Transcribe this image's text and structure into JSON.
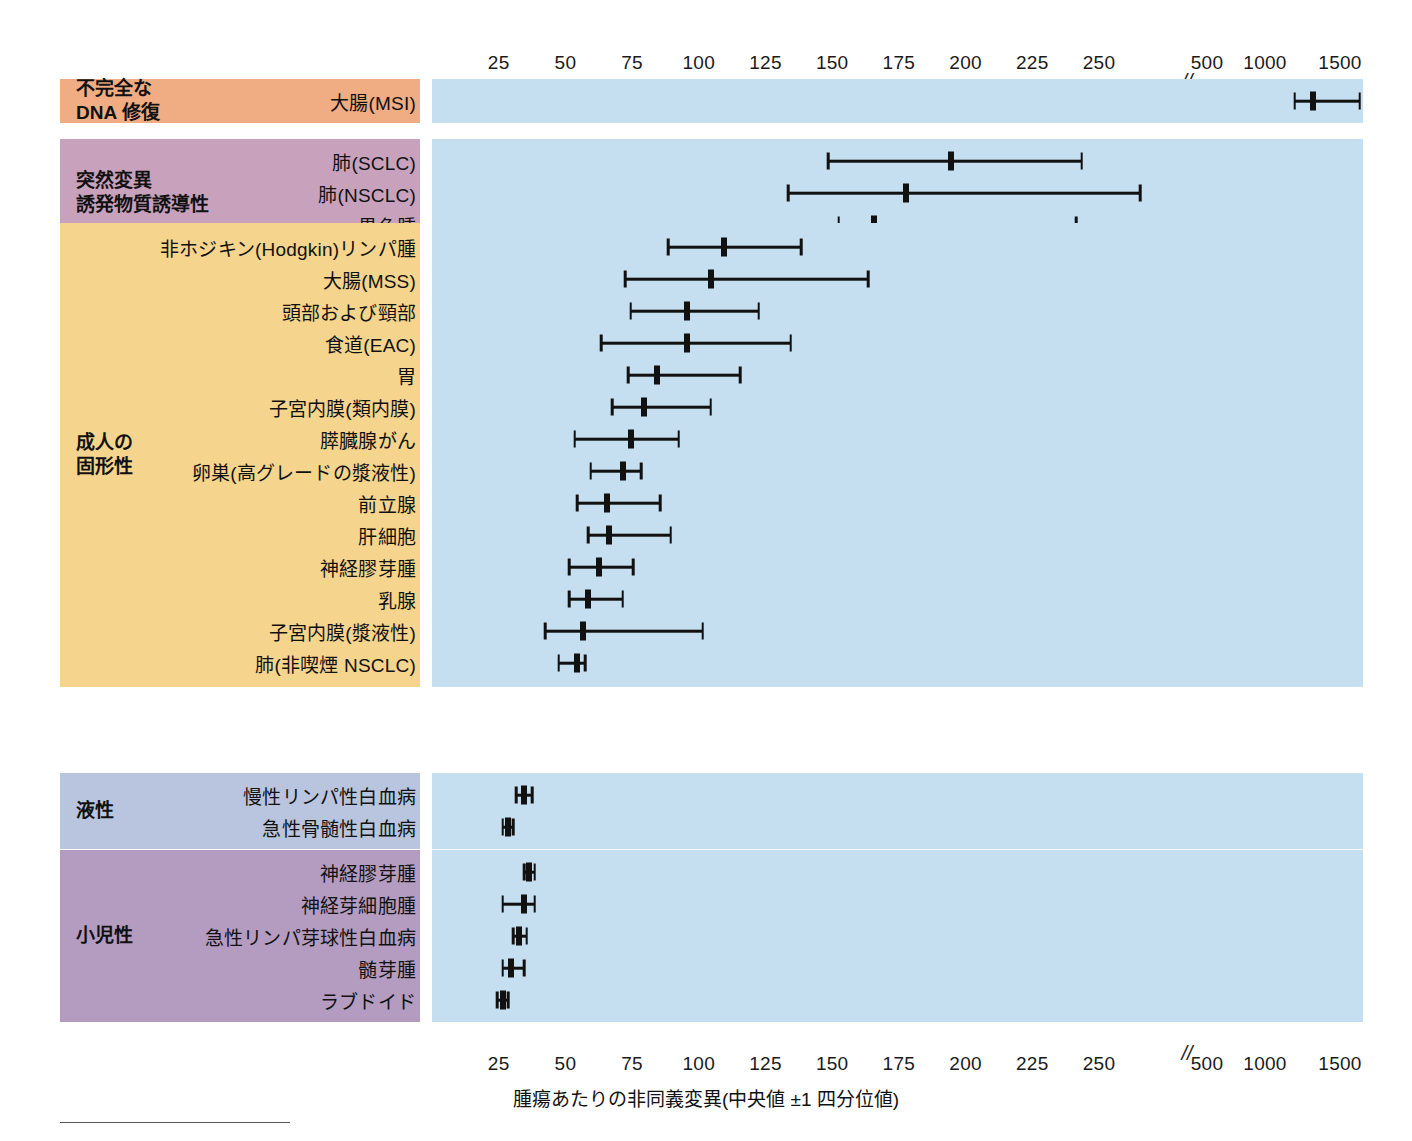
{
  "axis": {
    "caption": "腫瘍あたりの非同義変異(中央値 ±1 四分位値)",
    "break_symbol": "//",
    "ticks_linear": [
      "25",
      "50",
      "75",
      "100",
      "125",
      "150",
      "175",
      "200",
      "225",
      "250"
    ],
    "ticks_log": [
      "500",
      "1000",
      "1500"
    ]
  },
  "colors": {
    "plot_background": "#c6dff0",
    "page_background": "#ffffff",
    "mark_color": "#111111",
    "band_dna_repair": "#f0ac82",
    "band_mutagen": "#c8a2bd",
    "band_adult_solid": "#f5d48d",
    "band_liquid": "#b9c5de",
    "band_pediatric": "#b49bc0"
  },
  "chart_data": {
    "type": "scatter",
    "title": "",
    "xlabel": "腫瘍あたりの非同義変異(中央値 ±1 四分位値)",
    "ylabel": "",
    "xlim": [
      0,
      1500
    ],
    "axis_break_after": 250,
    "grid": false,
    "legend": "none",
    "sections": [
      {
        "name": "不完全な\nDNA 修復",
        "color": "#f0ac82",
        "rows": [
          {
            "label": "大腸(MSI)",
            "low": 740,
            "median": 900,
            "high": 1230
          }
        ]
      },
      {
        "name": "突然変異\n誘発物質誘導性",
        "color": "#c8a2bd",
        "rows": [
          {
            "label": "肺(SCLC)",
            "low": 126,
            "median": 172,
            "high": 221
          },
          {
            "label": "肺(NSCLC)",
            "low": 111,
            "median": 155,
            "high": 243
          },
          {
            "label": "黒色腫",
            "low": 130,
            "median": 143,
            "high": 219
          }
        ]
      },
      {
        "name": "成人の\n固形性",
        "color": "#f5d48d",
        "rows": [
          {
            "label": "非ホジキン(Hodgkin)リンパ腫",
            "low": 66,
            "median": 87,
            "high": 116
          },
          {
            "label": "大腸(MSS)",
            "low": 50,
            "median": 82,
            "high": 141
          },
          {
            "label": "頭部および頸部",
            "low": 52,
            "median": 73,
            "high": 100
          },
          {
            "label": "食道(EAC)",
            "low": 41,
            "median": 73,
            "high": 112
          },
          {
            "label": "胃",
            "low": 51,
            "median": 62,
            "high": 93
          },
          {
            "label": "子宮内膜(類内膜)",
            "low": 45,
            "median": 57,
            "high": 82
          },
          {
            "label": "膵臓腺がん",
            "low": 31,
            "median": 52,
            "high": 70
          },
          {
            "label": "卵巣(高グレードの漿液性)",
            "low": 37,
            "median": 49,
            "high": 56
          },
          {
            "label": "前立腺",
            "low": 32,
            "median": 43,
            "high": 63
          },
          {
            "label": "肝細胞",
            "low": 36,
            "median": 44,
            "high": 67
          },
          {
            "label": "神経膠芽腫",
            "low": 29,
            "median": 40,
            "high": 53
          },
          {
            "label": "乳腺",
            "low": 29,
            "median": 36,
            "high": 49
          },
          {
            "label": "子宮内膜(漿液性)",
            "low": 20,
            "median": 34,
            "high": 79
          },
          {
            "label": "肺(非喫煙 NSCLC)",
            "low": 25,
            "median": 32,
            "high": 35
          }
        ]
      },
      {
        "name": "液性",
        "color": "#b9c5de",
        "rows": [
          {
            "label": "慢性リンパ性白血病",
            "low": 9,
            "median": 12,
            "high": 15
          },
          {
            "label": "急性骨髄性白血病",
            "low": 4,
            "median": 6,
            "high": 8
          }
        ]
      },
      {
        "name": "小児性",
        "color": "#b49bc0",
        "rows": [
          {
            "label": "神経膠芽腫",
            "low": 12,
            "median": 14,
            "high": 16
          },
          {
            "label": "神経芽細胞腫",
            "low": 4,
            "median": 12,
            "high": 16
          },
          {
            "label": "急性リンパ芽球性白血病",
            "low": 8,
            "median": 10,
            "high": 13
          },
          {
            "label": "髄芽腫",
            "low": 4,
            "median": 7,
            "high": 12
          },
          {
            "label": "ラブドイド",
            "low": 2,
            "median": 4,
            "high": 6
          }
        ]
      }
    ]
  }
}
